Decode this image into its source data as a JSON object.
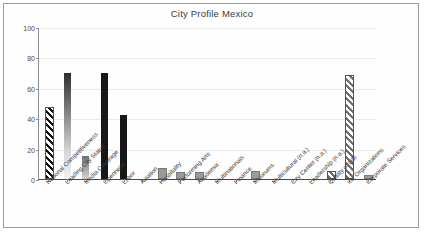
{
  "chart": {
    "title": "City Profile Mexico",
    "frame_color": "#9a9a9a",
    "axis_color": "#4a4a4a",
    "grid_color": "#e9e9e9"
  },
  "chart_data": {
    "type": "bar",
    "title": "City Profile Mexico",
    "xlabel": "",
    "ylabel": "",
    "ylim": [
      0,
      100
    ],
    "yticks": [
      0,
      20,
      40,
      60,
      80,
      100
    ],
    "grid": true,
    "legend": "none",
    "categories": [
      "National Competitiveness",
      "Leading City Status",
      "Media Coverage",
      "Openness",
      "Labor",
      "Aviation",
      "Hospitality",
      "Performing Arts",
      "Academia",
      "Multinationals",
      "Finance",
      "Museums",
      "Multicultural (n.a.)",
      "City Center (n.a.)",
      "Leadership (n.a.)",
      "Quality of Life",
      "Int. Organizations",
      "Corporate Services"
    ],
    "values": [
      46,
      70,
      15,
      70,
      42,
      0,
      6,
      3,
      3.5,
      0,
      0,
      4,
      0,
      0,
      0,
      4,
      67,
      1
    ],
    "bar_styles": [
      "diagonal-stripe-black",
      "gradient-dark-to-light",
      "gradient-gray",
      "solid-black",
      "solid-black",
      "none",
      "solid-gray",
      "solid-gray",
      "solid-gray",
      "none",
      "none",
      "solid-gray",
      "none",
      "none",
      "none",
      "diagonal-stripe-gray",
      "diagonal-stripe-gray",
      "solid-gray"
    ]
  }
}
